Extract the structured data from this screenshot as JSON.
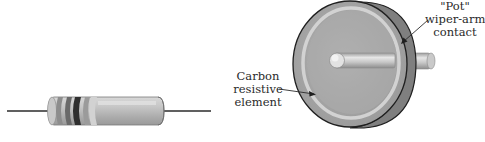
{
  "figure": {
    "components": [
      {
        "id": "fixed-resistor",
        "kind": "axial carbon resistor",
        "band_colors": [
          "#bdbdbd",
          "#8a8a8a",
          "#3c3c3c",
          "#a8a8a8"
        ],
        "body_color": "#b9b9b9"
      },
      {
        "id": "potentiometer",
        "kind": "rotary potentiometer",
        "disc_color": "#9c9c9c",
        "track_color": "#cfcfcf",
        "shaft_color": "#c4c4c4"
      }
    ],
    "labels": {
      "carbon_element": {
        "lines": [
          "Carbon",
          "resistive",
          "element"
        ]
      },
      "wiper_contact": {
        "lines": [
          "\"Pot\"",
          "wiper-arm",
          "contact"
        ]
      }
    }
  }
}
